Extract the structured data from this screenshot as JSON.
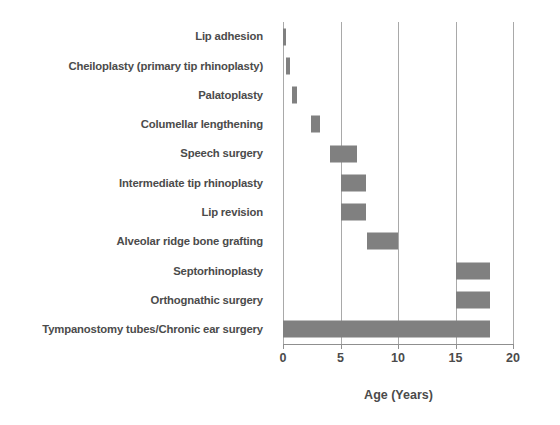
{
  "chart_data": {
    "type": "bar",
    "orientation": "horizontal",
    "subtype": "floating-range-bar",
    "title": "",
    "subtitle": "",
    "xlabel": "Age (Years)",
    "ylabel": "",
    "xlim": [
      0,
      20
    ],
    "xticks": [
      0,
      5,
      10,
      15,
      20
    ],
    "xtick_labels": [
      "0",
      "5",
      "10",
      "15",
      "20"
    ],
    "grid": "vertical",
    "gridlines_at": [
      5,
      10,
      15,
      20
    ],
    "legend": "none",
    "bar_color": "#808080",
    "axis_color": "#a9a9a9",
    "text_color": "#4b4b4b",
    "categories": [
      "Lip adhesion",
      "Cheiloplasty (primary tip rhinoplasty)",
      "Palatoplasty",
      "Columellar lengthening",
      "Speech surgery",
      "Intermediate tip rhinoplasty",
      "Lip revision",
      "Alveolar ridge bone grafting",
      "Septorhinoplasty",
      "Orthognathic surgery",
      "Tympanostomy tubes/Chronic ear surgery"
    ],
    "ranges": [
      {
        "category": "Lip adhesion",
        "start": 0.0,
        "end": 0.3
      },
      {
        "category": "Cheiloplasty (primary tip rhinoplasty)",
        "start": 0.25,
        "end": 0.6
      },
      {
        "category": "Palatoplasty",
        "start": 0.8,
        "end": 1.2
      },
      {
        "category": "Columellar lengthening",
        "start": 2.4,
        "end": 3.2
      },
      {
        "category": "Speech surgery",
        "start": 4.1,
        "end": 6.4
      },
      {
        "category": "Intermediate tip rhinoplasty",
        "start": 5.0,
        "end": 7.2
      },
      {
        "category": "Lip revision",
        "start": 5.0,
        "end": 7.2
      },
      {
        "category": "Alveolar ridge bone grafting",
        "start": 7.3,
        "end": 10.0
      },
      {
        "category": "Septorhinoplasty",
        "start": 15.0,
        "end": 18.0
      },
      {
        "category": "Orthognathic surgery",
        "start": 15.0,
        "end": 18.0
      },
      {
        "category": "Tympanostomy tubes/Chronic ear surgery",
        "start": 0.0,
        "end": 18.0
      }
    ],
    "series": [
      {
        "name": "start",
        "values": [
          0.0,
          0.25,
          0.8,
          2.4,
          4.1,
          5.0,
          5.0,
          7.3,
          15.0,
          15.0,
          0.0
        ]
      },
      {
        "name": "end",
        "values": [
          0.3,
          0.6,
          1.2,
          3.2,
          6.4,
          7.2,
          7.2,
          10.0,
          18.0,
          18.0,
          18.0
        ]
      }
    ]
  }
}
